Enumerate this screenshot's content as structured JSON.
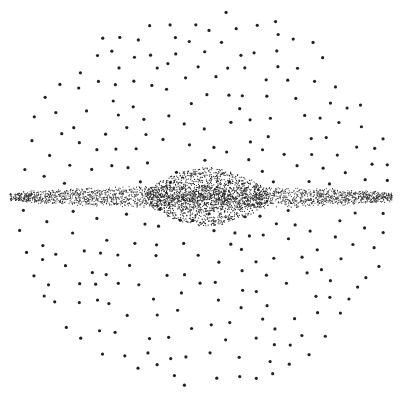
{
  "image": {
    "width": 404,
    "height": 395,
    "background": "#ffffff",
    "subject": "stippled galaxy illustration: spherical halo of dots with edge-on disk and central bulge"
  },
  "colors": {
    "halo_dot": "#222222",
    "disk_dot": "#2a2a2a",
    "bulge_dot": "#1e1e1e"
  },
  "halo": {
    "center": [
      204,
      197
    ],
    "radius": 190,
    "count": 260,
    "dot_radius": 1.6,
    "seed": 7
  },
  "disk": {
    "center": [
      204,
      197
    ],
    "x_start": 10,
    "x_end": 392,
    "half_thickness_edge": 8,
    "half_thickness_mid": 14,
    "count": 2600,
    "dot_radius": 0.55,
    "seed": 11
  },
  "bulge": {
    "center": [
      207,
      197
    ],
    "rx": 62,
    "ry": 30,
    "count": 1500,
    "dot_radius": 0.6,
    "seed": 23
  }
}
